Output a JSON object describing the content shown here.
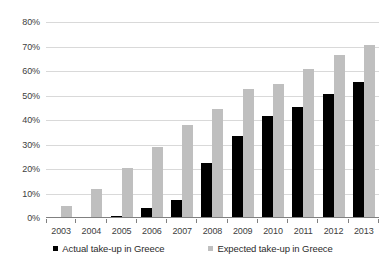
{
  "chart_data": {
    "type": "bar",
    "title": "",
    "xlabel": "",
    "ylabel": "",
    "ylim": [
      0,
      80
    ],
    "ytick_values": [
      80,
      70,
      60,
      50,
      40,
      30,
      20,
      10,
      0
    ],
    "ytick_labels": [
      "80%",
      "70%",
      "60%",
      "50%",
      "40%",
      "30%",
      "20%",
      "10%",
      "0%"
    ],
    "grid": true,
    "legend_position": "bottom",
    "categories": [
      "2003",
      "2004",
      "2005",
      "2006",
      "2007",
      "2008",
      "2009",
      "2010",
      "2011",
      "2012",
      "2013"
    ],
    "series": [
      {
        "name": "Actual take-up in Greece",
        "color": "#000000",
        "values": [
          0.5,
          0.3,
          0.7,
          4.0,
          7.5,
          22.5,
          33.5,
          41.5,
          45.5,
          50.5,
          55.5
        ]
      },
      {
        "name": "Expected take-up in Greece",
        "color": "#bfbfbf",
        "values": [
          5.0,
          12.0,
          20.5,
          29.0,
          38.0,
          44.5,
          52.5,
          54.5,
          61.0,
          66.5,
          70.5
        ]
      }
    ]
  },
  "legend": {
    "items": [
      {
        "label": "Actual take-up in Greece",
        "color": "#000000"
      },
      {
        "label": "Expected take-up in Greece",
        "color": "#bfbfbf"
      }
    ]
  }
}
